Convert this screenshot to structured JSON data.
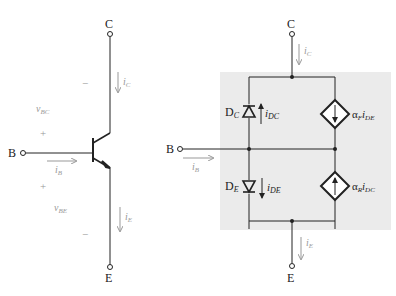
{
  "left_circuit": {
    "title": "NPN transistor symbol",
    "terminals": {
      "collector": "C",
      "base": "B",
      "emitter": "E"
    },
    "currents": {
      "ic": "i",
      "ic_sub": "C",
      "ib": "i",
      "ib_sub": "B",
      "ie": "i",
      "ie_sub": "E"
    },
    "voltages": {
      "vbc": "v",
      "vbc_sub": "BC",
      "vbe": "v",
      "vbe_sub": "BE"
    },
    "polarity": {
      "vbc_plus": "+",
      "vbc_minus": "−",
      "vbe_plus": "+",
      "vbe_minus": "−"
    }
  },
  "right_circuit": {
    "title": "Ebers-Moll model",
    "terminals": {
      "collector": "C",
      "base": "B",
      "emitter": "E"
    },
    "currents": {
      "ic": "i",
      "ic_sub": "C",
      "ib": "i",
      "ib_sub": "B",
      "ie": "i",
      "ie_sub": "E"
    },
    "diodes": [
      {
        "name": "D",
        "sub": "C",
        "current": "i",
        "current_sub": "DC"
      },
      {
        "name": "D",
        "sub": "E",
        "current": "i",
        "current_sub": "DE"
      }
    ],
    "sources": [
      {
        "alpha": "α",
        "alpha_sub": "F",
        "current": "i",
        "current_sub": "DE",
        "direction": "down"
      },
      {
        "alpha": "α",
        "alpha_sub": "R",
        "current": "i",
        "current_sub": "DC",
        "direction": "up"
      }
    ],
    "shade_color": "#ebebeb"
  }
}
